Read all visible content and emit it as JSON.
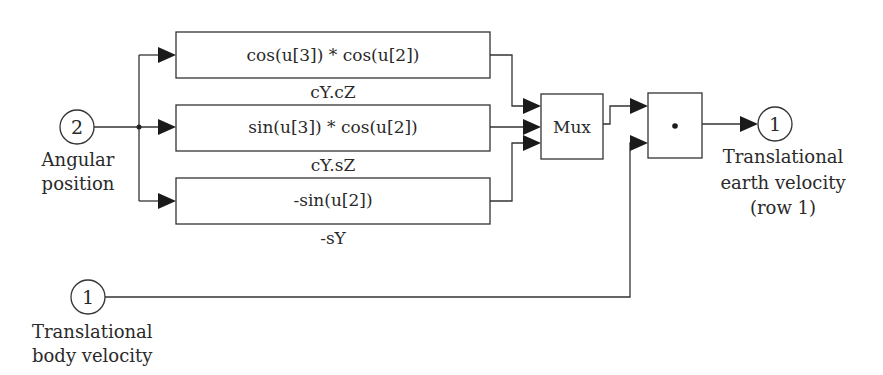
{
  "diagram": {
    "type": "simulink-block-diagram",
    "inports": [
      {
        "id": "in2",
        "number": "2",
        "label_lines": [
          "Angular",
          "position"
        ]
      },
      {
        "id": "in1",
        "number": "1",
        "label_lines": [
          "Translational",
          "body velocity"
        ]
      }
    ],
    "fcn_blocks": [
      {
        "id": "fcn1",
        "expression": "cos(u[3]) * cos(u[2])",
        "label": "cY.cZ"
      },
      {
        "id": "fcn2",
        "expression": "sin(u[3]) * cos(u[2])",
        "label": "cY.sZ"
      },
      {
        "id": "fcn3",
        "expression": "-sin(u[2])",
        "label": "-sY"
      }
    ],
    "mux": {
      "label": "Mux",
      "inputs": 3
    },
    "dot_product": {
      "symbol": "•",
      "inputs": 2
    },
    "outport": {
      "number": "1",
      "label_lines": [
        "Translational",
        "earth velocity",
        "(row 1)"
      ]
    },
    "connections": [
      "in2 -> fcn1",
      "in2 -> fcn2",
      "in2 -> fcn3",
      "fcn1 -> mux.1",
      "fcn2 -> mux.2",
      "fcn3 -> mux.3",
      "mux -> dot.1",
      "in1 -> dot.2",
      "dot -> out1"
    ]
  }
}
